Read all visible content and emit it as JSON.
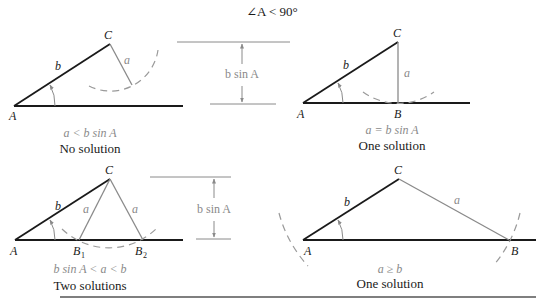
{
  "title": "∠A < 90°",
  "colors": {
    "side_b": "#1a1a1a",
    "side_a": "#8a8a8a",
    "arc": "#9a9a9a",
    "caption_condition": "#8a8a8a",
    "caption_result": "#1a1a1a"
  },
  "panels": [
    {
      "id": "no-solution",
      "vertex_labels": {
        "A": "A",
        "C": "C"
      },
      "side_labels": {
        "b": "b",
        "a": "a"
      },
      "condition": "a < b sin A",
      "result": "No solution"
    },
    {
      "id": "one-solution-right",
      "vertex_labels": {
        "A": "A",
        "B": "B",
        "C": "C"
      },
      "side_labels": {
        "b": "b",
        "a": "a"
      },
      "condition": "a = b sin A",
      "result": "One solution"
    },
    {
      "id": "two-solutions",
      "vertex_labels": {
        "A": "A",
        "B1": "B",
        "B1_sub": "1",
        "B2": "B",
        "B2_sub": "2",
        "C": "C"
      },
      "side_labels": {
        "b": "b",
        "a1": "a",
        "a2": "a"
      },
      "condition": "b sin A < a < b",
      "result": "Two solutions"
    },
    {
      "id": "one-solution-large-a",
      "vertex_labels": {
        "A": "A",
        "B": "B",
        "C": "C"
      },
      "side_labels": {
        "b": "b",
        "a": "a"
      },
      "condition": "a ≥ b",
      "result": "One solution"
    }
  ],
  "height_indicators": [
    {
      "label": "b sin A"
    },
    {
      "label": "b sin A"
    }
  ]
}
